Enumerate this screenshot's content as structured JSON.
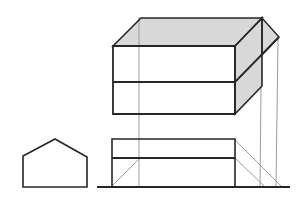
{
  "canvas": {
    "width": 306,
    "height": 203,
    "background": "#ffffff"
  },
  "colors": {
    "ink": "#262626",
    "construction": "#9c9c9c",
    "shaded": "#d8d8d8",
    "white": "#ffffff"
  },
  "figure": {
    "kind": "technical-drawing",
    "shapes": [
      {
        "name": "oblique-top-face-fill",
        "kind": "polygon",
        "closed": true,
        "points": [
          [
            113,
            46
          ],
          [
            141,
            18
          ],
          [
            262,
            18
          ],
          [
            235,
            46
          ]
        ],
        "fill": "shaded",
        "stroke": "none",
        "width": 0
      },
      {
        "name": "oblique-right-face-fill",
        "kind": "polygon",
        "closed": true,
        "points": [
          [
            235,
            46
          ],
          [
            262,
            18
          ],
          [
            262,
            86
          ],
          [
            235,
            114
          ]
        ],
        "fill": "shaded",
        "stroke": "none",
        "width": 0
      },
      {
        "name": "oblique-corner-flap-fill",
        "kind": "polygon",
        "closed": true,
        "points": [
          [
            262,
            18
          ],
          [
            279,
            37
          ],
          [
            262,
            55
          ]
        ],
        "fill": "shaded",
        "stroke": "none",
        "width": 0
      },
      {
        "name": "oblique-front-face-fill",
        "kind": "polygon",
        "closed": true,
        "points": [
          [
            113,
            46
          ],
          [
            235,
            46
          ],
          [
            235,
            114
          ],
          [
            113,
            114
          ]
        ],
        "fill": "white",
        "stroke": "none",
        "width": 0
      },
      {
        "name": "projection-line-left",
        "kind": "line",
        "points": [
          [
            139,
            17
          ],
          [
            139,
            187
          ]
        ],
        "fill": "none",
        "stroke": "construction",
        "width": 1
      },
      {
        "name": "projection-line-mid",
        "kind": "line",
        "points": [
          [
            261,
            87
          ],
          [
            260,
            187
          ]
        ],
        "fill": "none",
        "stroke": "construction",
        "width": 1
      },
      {
        "name": "projection-line-right",
        "kind": "line",
        "points": [
          [
            278,
            38
          ],
          [
            276,
            187
          ]
        ],
        "fill": "none",
        "stroke": "construction",
        "width": 1
      },
      {
        "name": "depth-diagonal-left",
        "kind": "line",
        "points": [
          [
            112,
            186
          ],
          [
            139,
            159
          ]
        ],
        "fill": "none",
        "stroke": "construction",
        "width": 1
      },
      {
        "name": "depth-diagonal-upper-right",
        "kind": "line",
        "points": [
          [
            235,
            140
          ],
          [
            281,
            186
          ]
        ],
        "fill": "none",
        "stroke": "construction",
        "width": 1
      },
      {
        "name": "depth-diagonal-lower-right",
        "kind": "line",
        "points": [
          [
            235,
            158
          ],
          [
            264,
            186
          ]
        ],
        "fill": "none",
        "stroke": "construction",
        "width": 1
      },
      {
        "name": "side-elevation-pentagon",
        "kind": "polygon",
        "closed": true,
        "points": [
          [
            23,
            187
          ],
          [
            23,
            156
          ],
          [
            55,
            139
          ],
          [
            87,
            157
          ],
          [
            87,
            187
          ]
        ],
        "fill": "white",
        "stroke": "ink",
        "width": 1.6
      },
      {
        "name": "ground-line",
        "kind": "line",
        "points": [
          [
            97,
            187
          ],
          [
            290,
            187
          ]
        ],
        "fill": "none",
        "stroke": "ink",
        "width": 2
      },
      {
        "name": "front-elevation-outline",
        "kind": "polygon",
        "closed": true,
        "points": [
          [
            112,
            139
          ],
          [
            235,
            139
          ],
          [
            235,
            187
          ],
          [
            112,
            187
          ]
        ],
        "fill": "none",
        "stroke": "ink",
        "width": 1.6
      },
      {
        "name": "front-elevation-divider-line",
        "kind": "line",
        "points": [
          [
            112,
            158
          ],
          [
            235,
            158
          ]
        ],
        "fill": "none",
        "stroke": "ink",
        "width": 2.2
      },
      {
        "name": "oblique-front-face-outline",
        "kind": "polygon",
        "closed": true,
        "points": [
          [
            113,
            46
          ],
          [
            235,
            46
          ],
          [
            235,
            114
          ],
          [
            113,
            114
          ]
        ],
        "fill": "none",
        "stroke": "ink",
        "width": 1.8
      },
      {
        "name": "oblique-front-divider-line",
        "kind": "line",
        "points": [
          [
            113,
            82
          ],
          [
            235,
            82
          ]
        ],
        "fill": "none",
        "stroke": "ink",
        "width": 2.2
      },
      {
        "name": "oblique-top-face-outline",
        "kind": "polygon",
        "closed": true,
        "points": [
          [
            113,
            46
          ],
          [
            141,
            18
          ],
          [
            262,
            18
          ],
          [
            235,
            46
          ]
        ],
        "fill": "none",
        "stroke": "ink",
        "width": 1.6
      },
      {
        "name": "oblique-right-face-outline",
        "kind": "polygon",
        "closed": true,
        "points": [
          [
            235,
            46
          ],
          [
            262,
            18
          ],
          [
            262,
            86
          ],
          [
            235,
            114
          ]
        ],
        "fill": "none",
        "stroke": "ink",
        "width": 1.6
      },
      {
        "name": "oblique-corner-flap-outline",
        "kind": "polygon",
        "closed": true,
        "points": [
          [
            262,
            18
          ],
          [
            279,
            37
          ],
          [
            262,
            55
          ]
        ],
        "fill": "none",
        "stroke": "ink",
        "width": 1.4
      },
      {
        "name": "oblique-divider-receding-line",
        "kind": "line",
        "points": [
          [
            235,
            82
          ],
          [
            279,
            37
          ]
        ],
        "fill": "none",
        "stroke": "ink",
        "width": 1.8
      }
    ]
  }
}
